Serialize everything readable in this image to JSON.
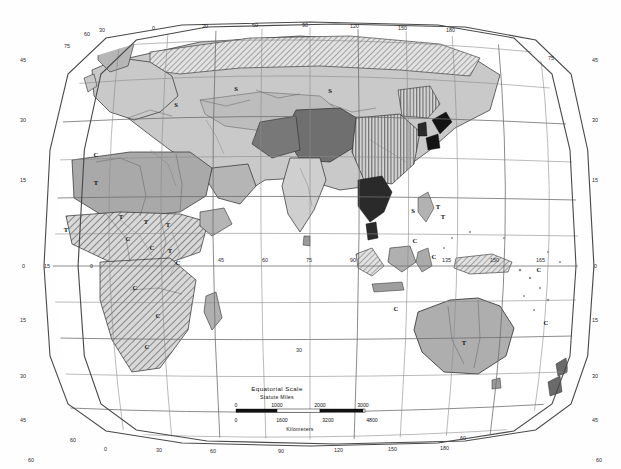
{
  "map": {
    "title_hidden": "Eastern Hemisphere Climate and Vegetation Map",
    "projection_note": "curved graticule world map, Eastern Hemisphere",
    "background_color": "#fefefe",
    "frame_color": "#4a4a4a",
    "graticule_color": "#8b8b8b",
    "coast_color": "#2b2b2b",
    "fills": {
      "light_gray": "#c9c9c9",
      "medium_gray": "#a3a3a3",
      "dark_gray": "#6f6f6f",
      "darkest_gray": "#3f3f3f",
      "white": "#ffffff",
      "hatch_diagonal": "#b8b8b8",
      "vertical_stripe": "#b0b0b0",
      "black": "#141414"
    }
  },
  "graticule": {
    "longitude_top": [
      "60",
      "30",
      "0",
      "30",
      "60",
      "90",
      "120",
      "150",
      "180"
    ],
    "longitude_bottom": [
      "0",
      "30",
      "60",
      "90",
      "120",
      "150",
      "180"
    ],
    "longitude_equator": [
      "15",
      "0",
      "45",
      "60",
      "75",
      "90",
      "135",
      "150",
      "165"
    ],
    "latitude_left": [
      "45",
      "30",
      "15",
      "0",
      "15",
      "30",
      "45",
      "60"
    ],
    "latitude_right": [
      "45",
      "30",
      "15",
      "0",
      "15",
      "30",
      "45",
      "60"
    ],
    "latitude_corner_top_left": "75",
    "latitude_corner_top_right": "75",
    "latitude_corner_bottom_left": "60",
    "latitude_corner_bottom_right": "60",
    "interior_latitude_mid": "30"
  },
  "climate_labels": [
    {
      "code": "S",
      "x": 176,
      "y": 107
    },
    {
      "code": "S",
      "x": 236,
      "y": 91
    },
    {
      "code": "S",
      "x": 330,
      "y": 93
    },
    {
      "code": "S",
      "x": 413,
      "y": 213
    },
    {
      "code": "T",
      "x": 96,
      "y": 185
    },
    {
      "code": "T",
      "x": 66,
      "y": 232
    },
    {
      "code": "T",
      "x": 121,
      "y": 219
    },
    {
      "code": "T",
      "x": 146,
      "y": 224
    },
    {
      "code": "T",
      "x": 168,
      "y": 227
    },
    {
      "code": "T",
      "x": 170,
      "y": 253
    },
    {
      "code": "T",
      "x": 438,
      "y": 209
    },
    {
      "code": "T",
      "x": 443,
      "y": 219
    },
    {
      "code": "T",
      "x": 464,
      "y": 345
    },
    {
      "code": "C",
      "x": 96,
      "y": 157
    },
    {
      "code": "C",
      "x": 128,
      "y": 241
    },
    {
      "code": "C",
      "x": 152,
      "y": 250
    },
    {
      "code": "C",
      "x": 178,
      "y": 265
    },
    {
      "code": "C",
      "x": 135,
      "y": 290
    },
    {
      "code": "C",
      "x": 158,
      "y": 318
    },
    {
      "code": "C",
      "x": 147,
      "y": 349
    },
    {
      "code": "C",
      "x": 415,
      "y": 243
    },
    {
      "code": "C",
      "x": 434,
      "y": 259
    },
    {
      "code": "C",
      "x": 396,
      "y": 311
    },
    {
      "code": "C",
      "x": 546,
      "y": 325
    },
    {
      "code": "C",
      "x": 539,
      "y": 272
    }
  ],
  "scale": {
    "title": "Equatorial Scale",
    "subtitle_top": "Statute Miles",
    "subtitle_bottom": "Kilometers",
    "miles_ticks": [
      "0",
      "1000",
      "2000",
      "3000"
    ],
    "km_ticks": [
      "0",
      "1600",
      "3200",
      "4800"
    ]
  }
}
